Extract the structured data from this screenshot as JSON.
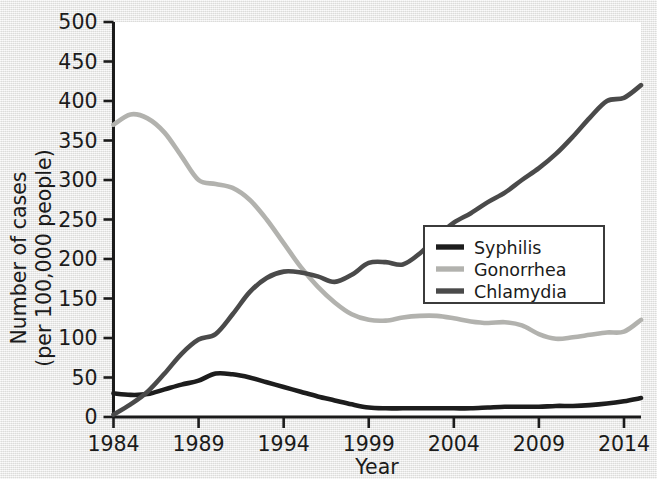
{
  "chart_data": {
    "type": "line",
    "title": "",
    "xlabel": "Year",
    "ylabel": "Number of cases (per 100,000 people)",
    "ylabel_line1": "Number of cases",
    "ylabel_line2": "(per 100,000 people)",
    "xlim": [
      1984,
      2015
    ],
    "ylim": [
      0,
      500
    ],
    "grid": false,
    "legend_position": "center-right",
    "x_ticks": [
      1984,
      1989,
      1994,
      1999,
      2004,
      2009,
      2014
    ],
    "x_tick_labels": [
      "1984",
      "1989",
      "1994",
      "1999",
      "2004",
      "2009",
      "2014"
    ],
    "y_ticks": [
      0,
      50,
      100,
      150,
      200,
      250,
      300,
      350,
      400,
      450,
      500
    ],
    "y_tick_labels": [
      "0",
      "50",
      "100",
      "150",
      "200",
      "250",
      "300",
      "350",
      "400",
      "450",
      "500"
    ],
    "x": [
      1984,
      1985,
      1986,
      1987,
      1988,
      1989,
      1990,
      1991,
      1992,
      1993,
      1994,
      1995,
      1996,
      1997,
      1998,
      1999,
      2000,
      2001,
      2002,
      2003,
      2004,
      2005,
      2006,
      2007,
      2008,
      2009,
      2010,
      2011,
      2012,
      2013,
      2014,
      2015
    ],
    "series": [
      {
        "name": "Syphilis",
        "color": "#1d1d1d",
        "values": [
          30,
          28,
          29,
          35,
          41,
          46,
          55,
          54,
          50,
          44,
          38,
          32,
          26,
          21,
          16,
          12,
          11,
          11,
          11,
          11,
          11,
          11,
          12,
          13,
          13,
          13,
          14,
          14,
          15,
          17,
          20,
          24
        ]
      },
      {
        "name": "Gonorrhea",
        "color": "#b2b2ae",
        "values": [
          370,
          383,
          378,
          360,
          330,
          300,
          295,
          290,
          275,
          250,
          220,
          190,
          165,
          145,
          130,
          123,
          122,
          126,
          128,
          128,
          125,
          121,
          119,
          120,
          116,
          105,
          99,
          101,
          104,
          107,
          108,
          123
        ]
      },
      {
        "name": "Chlamydia",
        "color": "#4a4a4a",
        "values": [
          3,
          16,
          32,
          55,
          80,
          98,
          105,
          130,
          158,
          176,
          184,
          183,
          178,
          171,
          180,
          195,
          196,
          193,
          207,
          228,
          246,
          258,
          272,
          284,
          300,
          315,
          333,
          355,
          379,
          400,
          404,
          420
        ]
      }
    ],
    "series_extended_note": "",
    "legend_entries": [
      "Syphilis",
      "Gonorrhea",
      "Chlamydia"
    ]
  },
  "legend": {
    "items": [
      {
        "label": "Syphilis",
        "color": "#1d1d1d"
      },
      {
        "label": "Gonorrhea",
        "color": "#b2b2ae"
      },
      {
        "label": "Chlamydia",
        "color": "#4a4a4a"
      }
    ],
    "border_color": "#3b3b3b",
    "background": "#ffffff"
  },
  "axis": {
    "x_title": "Year",
    "y_title_line1": "Number of cases",
    "y_title_line2": "(per 100,000 people)",
    "color": "#1b1b1b"
  },
  "plot": {
    "background": "#ffffff",
    "page_background": "#ececeb"
  }
}
